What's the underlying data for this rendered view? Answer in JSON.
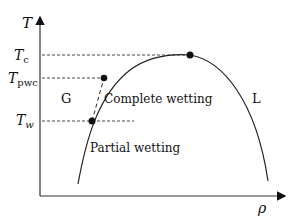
{
  "diagram": {
    "title": "",
    "axes": {
      "y_label": "T",
      "x_label": "ρ"
    },
    "tick_labels": {
      "tc": {
        "main": "T",
        "sub": "c"
      },
      "tpwc": {
        "main": "T",
        "sub": "pwc"
      },
      "tw": {
        "main": "T",
        "sub": "w"
      }
    },
    "regions": {
      "gas": "G",
      "liquid": "L",
      "complete_wetting": "Complete wetting",
      "partial_wetting": "Partial wetting"
    },
    "colors": {
      "line": "#222222",
      "background": "#ffffff"
    }
  }
}
